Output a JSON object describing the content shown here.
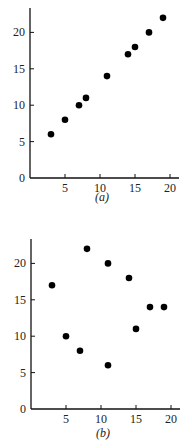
{
  "chart_data": [
    {
      "type": "scatter",
      "title": "",
      "caption": "(a)",
      "xlabel": "",
      "ylabel": "",
      "xlim": [
        0,
        21
      ],
      "ylim": [
        0,
        23.5
      ],
      "xticks": [
        5,
        10,
        15,
        20
      ],
      "yticks": [
        0,
        5,
        10,
        15,
        20
      ],
      "grid": false,
      "x": [
        3,
        5,
        7,
        8,
        11,
        14,
        15,
        17,
        19
      ],
      "y": [
        6,
        8,
        10,
        11,
        14,
        17,
        18,
        20,
        22
      ],
      "marker_color": "#000000"
    },
    {
      "type": "scatter",
      "title": "",
      "caption": "(b)",
      "xlabel": "",
      "ylabel": "",
      "xlim": [
        0,
        21
      ],
      "ylim": [
        0,
        23.5
      ],
      "xticks": [
        5,
        10,
        15,
        20
      ],
      "yticks": [
        0,
        5,
        10,
        15,
        20
      ],
      "grid": false,
      "x": [
        3,
        5,
        7,
        8,
        11,
        11,
        14,
        15,
        17,
        19
      ],
      "y": [
        17,
        10,
        8,
        22,
        20,
        6,
        18,
        11,
        14,
        14
      ],
      "marker_color": "#000000"
    }
  ]
}
